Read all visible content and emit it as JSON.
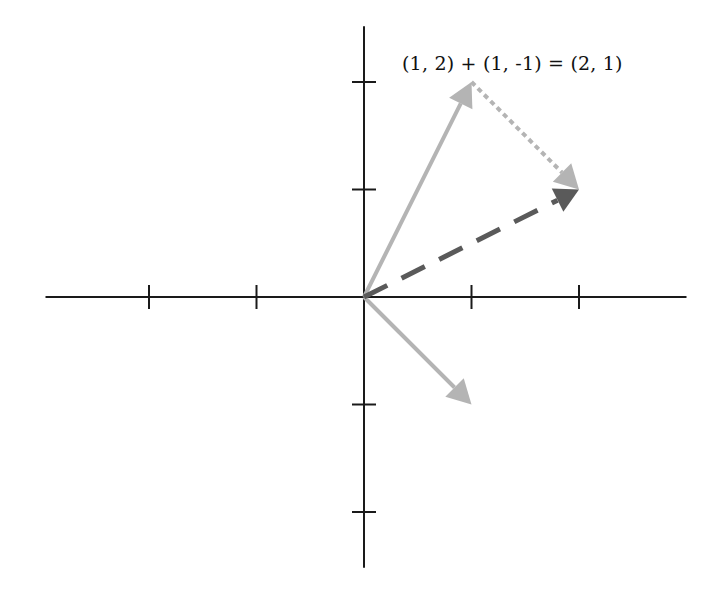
{
  "diagram": {
    "equation": "(1, 2) + (1, -1) = (2, 1)",
    "origin_px": [
      364,
      297
    ],
    "unit_px": 107.5,
    "axes": {
      "x_range": [
        -3,
        3
      ],
      "y_range": [
        -2.5,
        2.5
      ],
      "x_ticks": [
        -2,
        -1,
        1,
        2
      ],
      "y_ticks": [
        -2,
        -1,
        1,
        2
      ],
      "color": "#1a1a1a"
    },
    "vectors": [
      {
        "name": "a",
        "from": [
          0,
          0
        ],
        "to": [
          1,
          2
        ],
        "style": "solid",
        "color": "#b4b4b4",
        "label": "(1, 2)"
      },
      {
        "name": "b",
        "from": [
          0,
          0
        ],
        "to": [
          1,
          -1
        ],
        "style": "solid",
        "color": "#b4b4b4",
        "label": "(1, -1)"
      },
      {
        "name": "b-translated",
        "from": [
          1,
          2
        ],
        "to": [
          2,
          1
        ],
        "style": "dotted",
        "color": "#b4b4b4",
        "label": "(1, -1)"
      },
      {
        "name": "sum",
        "from": [
          0,
          0
        ],
        "to": [
          2,
          1
        ],
        "style": "dashed",
        "color": "#5a5a5a",
        "label": "(2, 1)"
      }
    ]
  }
}
